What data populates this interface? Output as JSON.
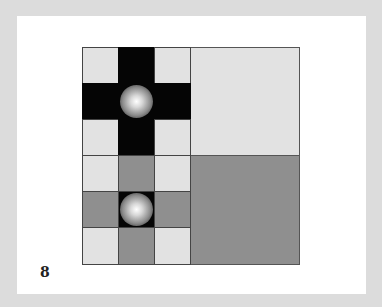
{
  "page": {
    "number": "8",
    "colors": {
      "background": "#dcdcdc",
      "paper": "#ffffff",
      "light": "#e2e2e2",
      "dark": "#050505",
      "mid": "#8f8f8f"
    }
  },
  "figure": {
    "top_left_grid": {
      "rows": [
        [
          "light",
          "dark",
          "light"
        ],
        [
          "dark",
          "dark-sphere",
          "dark"
        ],
        [
          "light",
          "dark",
          "light"
        ]
      ]
    },
    "top_right_square": "light",
    "bottom_left_grid": {
      "rows": [
        [
          "light",
          "mid",
          "light"
        ],
        [
          "mid",
          "dark-sphere",
          "mid"
        ],
        [
          "light",
          "mid",
          "light"
        ]
      ]
    },
    "bottom_right_square": "mid"
  }
}
